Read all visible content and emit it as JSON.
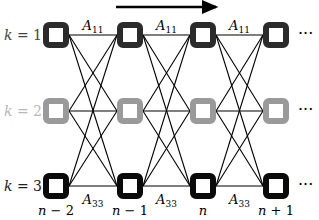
{
  "diagram": {
    "direction_arrow": {
      "x1": 116,
      "x2": 222,
      "y": 7,
      "color": "#000000"
    },
    "columns": [
      {
        "label": "n − 2",
        "x": 56
      },
      {
        "label": "n − 1",
        "x": 130
      },
      {
        "label": "n",
        "x": 203
      },
      {
        "label": "n + 1",
        "x": 276
      }
    ],
    "rows": [
      {
        "label": "k = 1",
        "y": 35,
        "color": "#2b2b2b",
        "label_color": "#444444"
      },
      {
        "label": "k = 2",
        "y": 111,
        "color": "#9a9a9a",
        "label_color": "#b8b8b8"
      },
      {
        "label": "k = 3",
        "y": 186,
        "color": "#0a0a0a",
        "label_color": "#222222"
      }
    ],
    "node_size": 26,
    "ellipsis": "···",
    "edge_labels_top": {
      "text": "A",
      "sub": "11"
    },
    "edge_labels_bottom": {
      "text": "A",
      "sub": "33"
    }
  }
}
